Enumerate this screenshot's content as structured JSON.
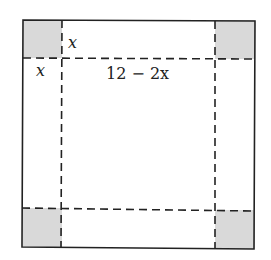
{
  "diagram": {
    "title": "",
    "labels": {
      "corner_side": "x",
      "corner_top": "x",
      "middle_length": "12 − 2x"
    },
    "colors": {
      "corner_fill": "#d9d9d9",
      "line": "#222222",
      "background": "#ffffff"
    },
    "shapes": {
      "outer_square": {
        "x": 23,
        "y": 20,
        "w": 232,
        "h": 228
      },
      "corner_squares": [
        "top-left",
        "top-right",
        "bottom-left",
        "bottom-right"
      ],
      "dashed_lines": {
        "vertical_x": [
          62,
          215
        ],
        "horizontal_y": [
          58,
          210
        ]
      }
    }
  }
}
